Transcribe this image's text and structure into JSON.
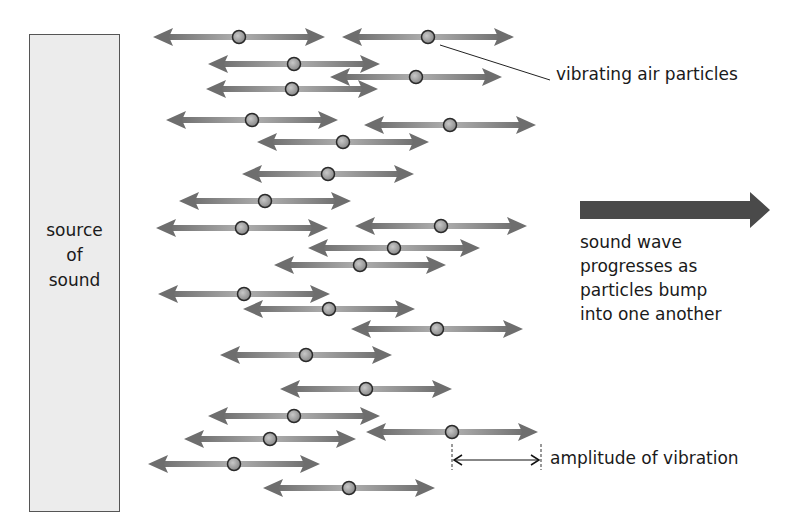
{
  "source": {
    "lines": [
      "source",
      "of",
      "sound"
    ]
  },
  "labels": {
    "particles": "vibrating air particles",
    "wave": [
      "sound wave",
      "progresses as",
      "particles bump",
      "into one another"
    ],
    "amplitude": "amplitude of vibration"
  },
  "colors": {
    "arrow": "#6e6e6e",
    "arrow_light": "#a9a9a9",
    "particle_fill": "#9a9a9a",
    "particle_stroke": "#2a2a2a",
    "wave_arrow": "#4a4a4a",
    "source_fill": "#ececec"
  },
  "particles": [
    {
      "x": 239,
      "y": 37
    },
    {
      "x": 428,
      "y": 37
    },
    {
      "x": 294,
      "y": 64
    },
    {
      "x": 416,
      "y": 77
    },
    {
      "x": 292,
      "y": 89
    },
    {
      "x": 252,
      "y": 120
    },
    {
      "x": 450,
      "y": 125
    },
    {
      "x": 343,
      "y": 142
    },
    {
      "x": 328,
      "y": 174
    },
    {
      "x": 265,
      "y": 201
    },
    {
      "x": 242,
      "y": 228
    },
    {
      "x": 441,
      "y": 226
    },
    {
      "x": 394,
      "y": 248
    },
    {
      "x": 360,
      "y": 265
    },
    {
      "x": 244,
      "y": 294
    },
    {
      "x": 329,
      "y": 309
    },
    {
      "x": 437,
      "y": 329
    },
    {
      "x": 306,
      "y": 355
    },
    {
      "x": 366,
      "y": 389
    },
    {
      "x": 294,
      "y": 416
    },
    {
      "x": 270,
      "y": 439
    },
    {
      "x": 452,
      "y": 432
    },
    {
      "x": 234,
      "y": 464
    },
    {
      "x": 349,
      "y": 488
    }
  ],
  "arrow_half_span": 86,
  "leader_line": {
    "from": {
      "x": 440,
      "y": 45
    },
    "to": {
      "x": 550,
      "y": 80
    }
  },
  "amplitude_marker": {
    "x1": 452,
    "x2": 541,
    "y": 460,
    "tick_top": 444,
    "tick_bottom": 470
  },
  "wave_arrow": {
    "x1": 580,
    "x2": 770,
    "y": 210
  }
}
